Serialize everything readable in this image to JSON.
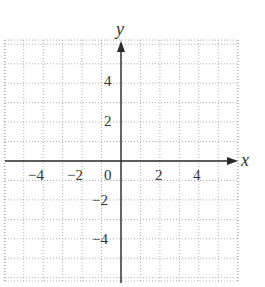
{
  "chart_data": {
    "type": "coordinate-grid",
    "title": "",
    "xlabel": "x",
    "ylabel": "y",
    "x_ticks": [
      "-4",
      "-2",
      "0",
      "2",
      "4"
    ],
    "y_ticks": [
      "4",
      "2",
      "-2",
      "-4"
    ],
    "xlim": [
      -6,
      6
    ],
    "ylim": [
      -6.2,
      6.2
    ],
    "grid": true,
    "grid_style": "dotted",
    "grid_step": 1,
    "series": []
  },
  "axes": {
    "x_label": "x",
    "y_label": "y",
    "x_tick_labels": [
      {
        "value": -4,
        "text": "−4"
      },
      {
        "value": -2,
        "text": "−2"
      },
      {
        "value": 0,
        "text": "0"
      },
      {
        "value": 2,
        "text": "2"
      },
      {
        "value": 4,
        "text": "4"
      }
    ],
    "y_tick_labels": [
      {
        "value": 4,
        "text": "4"
      },
      {
        "value": 2,
        "text": "2"
      },
      {
        "value": -2,
        "text": "−2"
      },
      {
        "value": -4,
        "text": "−4"
      }
    ]
  },
  "colors": {
    "grid": "#9a9a9a",
    "axis": "#2a2a2a",
    "text": "#333333"
  }
}
